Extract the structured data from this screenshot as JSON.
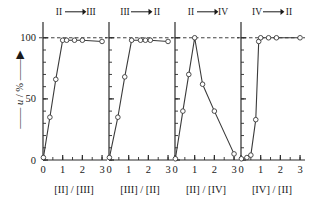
{
  "figure": {
    "y_axis_label": "—— u / % ——▶",
    "y_axis_label_parts": {
      "prefix": "——",
      "variable": "u",
      "unit": "/ %",
      "suffix": "——▶"
    },
    "y_ticks": [
      0,
      50,
      100
    ],
    "y_tick_labels": [
      "0",
      "50",
      "100"
    ],
    "y_minor_step": 10,
    "ylim": [
      0,
      108
    ],
    "x_ticks": [
      0,
      1,
      2,
      3
    ],
    "x_tick_labels": [
      "0",
      "1",
      "2",
      "3"
    ],
    "x_minor_step": 0.5,
    "xlim": [
      0,
      3.15
    ],
    "reference_line_value": 100,
    "reference_line_style": "dashed",
    "marker_style": "open-circle",
    "line_color": "#3a3a3a",
    "marker_face_color": "#ffffff",
    "axis_color": "#2b2b2b"
  },
  "chart_data": [
    {
      "type": "line",
      "title": "II ⟶ III",
      "title_from": "II",
      "title_to": "III",
      "xlabel": "[II] / [III]",
      "ylabel": "u / %",
      "xlim": [
        0,
        3.15
      ],
      "ylim": [
        0,
        108
      ],
      "grid": false,
      "x": [
        0.02,
        0.35,
        0.65,
        1.0,
        1.2,
        1.6,
        2.0,
        3.0
      ],
      "values": [
        2,
        35,
        66,
        98,
        98,
        98,
        98,
        97
      ],
      "reference_line": 100
    },
    {
      "type": "line",
      "title": "III ⟶ II",
      "title_from": "III",
      "title_to": "II",
      "xlabel": "[III] / [II]",
      "ylabel": "u / %",
      "xlim": [
        0,
        3.15
      ],
      "ylim": [
        0,
        108
      ],
      "grid": false,
      "x": [
        0.02,
        0.45,
        0.8,
        1.15,
        1.6,
        1.85,
        2.1,
        3.0
      ],
      "values": [
        2,
        35,
        68,
        98,
        98,
        98,
        98,
        97
      ],
      "reference_line": 100
    },
    {
      "type": "line",
      "title": "II ⟶ IV",
      "title_from": "II",
      "title_to": "IV",
      "xlabel": "[II] / [IV]",
      "ylabel": "u / %",
      "xlim": [
        0,
        3.15
      ],
      "ylim": [
        0,
        108
      ],
      "grid": false,
      "x": [
        0.02,
        0.4,
        0.7,
        1.0,
        1.4,
        2.0,
        3.0
      ],
      "values": [
        1,
        40,
        70,
        100,
        62,
        40,
        5
      ],
      "reference_line": 100
    },
    {
      "type": "line",
      "title": "IV ⟶ II",
      "title_from": "IV",
      "title_to": "II",
      "xlabel": "[IV] / [II]",
      "ylabel": "u / %",
      "xlim": [
        0,
        3.15
      ],
      "ylim": [
        0,
        108
      ],
      "grid": false,
      "x": [
        0.02,
        0.3,
        0.5,
        0.75,
        0.9,
        1.0,
        1.4,
        1.8,
        3.0
      ],
      "values": [
        1,
        2,
        4,
        33,
        97,
        100,
        100,
        100,
        100
      ],
      "reference_line": 100
    }
  ]
}
